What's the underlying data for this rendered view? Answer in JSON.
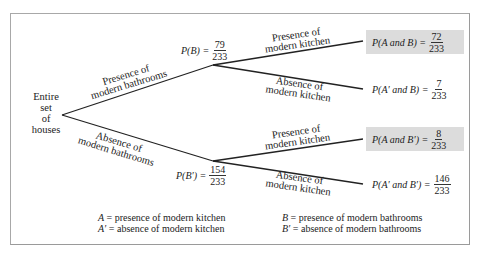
{
  "root": {
    "label_lines": [
      "Entire",
      "set",
      "of",
      "houses"
    ]
  },
  "branches": {
    "bath_presence": {
      "lines": [
        "Presence of",
        "modern bathrooms"
      ]
    },
    "bath_absence": {
      "lines": [
        "Absence of",
        "modern bathrooms"
      ]
    },
    "kitchen_presence_upper": {
      "lines": [
        "Presence of",
        "modern kitchen"
      ]
    },
    "kitchen_absence_upper": {
      "lines": [
        "Absence of",
        "modern kitchen"
      ]
    },
    "kitchen_presence_lower": {
      "lines": [
        "Presence of",
        "modern kitchen"
      ]
    },
    "kitchen_absence_lower": {
      "lines": [
        "Absence of",
        "modern kitchen"
      ]
    }
  },
  "nodes": {
    "pB": {
      "label": "P(B) =",
      "num": "79",
      "den": "233"
    },
    "pBp": {
      "label": "P(B′) =",
      "num": "154",
      "den": "233"
    }
  },
  "outcomes": [
    {
      "label": "P(A and B) =",
      "num": "72",
      "den": "233",
      "highlighted": true
    },
    {
      "label": "P(A′ and B) =",
      "num": "7",
      "den": "233",
      "highlighted": false
    },
    {
      "label": "P(A and B′) =",
      "num": "8",
      "den": "233",
      "highlighted": true
    },
    {
      "label": "P(A′ and B′) =",
      "num": "146",
      "den": "233",
      "highlighted": false
    }
  ],
  "legend": {
    "left": [
      {
        "sym": "A",
        "text": " = presence of modern kitchen"
      },
      {
        "sym": "A′",
        "text": " = absence of modern kitchen"
      }
    ],
    "right": [
      {
        "sym": "B",
        "text": " = presence of modern bathrooms"
      },
      {
        "sym": "B′",
        "text": " = absence of modern bathrooms"
      }
    ]
  },
  "colors": {
    "highlight": "#dcdcdc",
    "border": "#a8a8a8",
    "line": "#222222"
  }
}
